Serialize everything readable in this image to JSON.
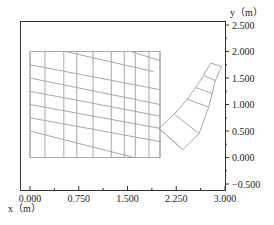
{
  "chart_data": {
    "type": "diagram",
    "title": "",
    "xlabel": "x（m）",
    "ylabel": "y（m）",
    "xlim": [
      0.0,
      3.0
    ],
    "ylim": [
      -0.5,
      2.5
    ],
    "x_ticks": [
      "0.000",
      "0.750",
      "1.500",
      "2.250",
      "3.000"
    ],
    "y_ticks": [
      "2.500",
      "2.000",
      "1.500",
      "1.000",
      "0.500",
      "0.000",
      "-0.500"
    ],
    "grid": false,
    "line_color": "#a8a8a8",
    "axis_color": "#333333",
    "block": {
      "x0": 0.0,
      "x1": 2.0,
      "y0": 0.0,
      "y1": 2.0,
      "vertical_lines_x": [
        0.0,
        0.23,
        0.52,
        0.72,
        0.97,
        1.25,
        1.45,
        1.62,
        1.83,
        2.0
      ],
      "sloped_lines": [
        {
          "x0": 0.0,
          "y0": 1.75,
          "x1": 2.0,
          "y1": 1.28
        },
        {
          "x0": 0.0,
          "y0": 1.5,
          "x1": 2.0,
          "y1": 1.0
        },
        {
          "x0": 0.0,
          "y0": 1.25,
          "x1": 2.0,
          "y1": 0.78
        },
        {
          "x0": 0.0,
          "y0": 1.0,
          "x1": 2.0,
          "y1": 0.55
        },
        {
          "x0": 0.0,
          "y0": 0.75,
          "x1": 2.0,
          "y1": 0.3
        },
        {
          "x0": 0.0,
          "y0": 0.5,
          "x1": 1.6,
          "y1": 0.0
        },
        {
          "x0": 0.55,
          "y0": 2.0,
          "x1": 1.9,
          "y1": 1.62
        },
        {
          "x0": 1.55,
          "y0": 2.0,
          "x1": 2.0,
          "y1": 1.83
        }
      ]
    },
    "arm": {
      "outer_edge": [
        [
          1.98,
          0.55
        ],
        [
          2.35,
          0.15
        ],
        [
          2.6,
          0.45
        ],
        [
          2.75,
          0.95
        ],
        [
          2.85,
          1.45
        ],
        [
          2.95,
          1.72
        ]
      ],
      "inner_edge": [
        [
          1.98,
          0.55
        ],
        [
          2.22,
          0.82
        ],
        [
          2.42,
          1.1
        ],
        [
          2.55,
          1.32
        ],
        [
          2.67,
          1.55
        ],
        [
          2.78,
          1.78
        ]
      ],
      "cross_lines": [
        [
          [
            1.98,
            0.55
          ],
          [
            2.35,
            0.15
          ]
        ],
        [
          [
            2.22,
            0.82
          ],
          [
            2.6,
            0.45
          ]
        ],
        [
          [
            2.42,
            1.1
          ],
          [
            2.75,
            0.95
          ]
        ],
        [
          [
            2.55,
            1.32
          ],
          [
            2.82,
            1.2
          ]
        ],
        [
          [
            2.67,
            1.55
          ],
          [
            2.85,
            1.45
          ]
        ],
        [
          [
            2.78,
            1.78
          ],
          [
            2.95,
            1.72
          ]
        ]
      ]
    }
  }
}
